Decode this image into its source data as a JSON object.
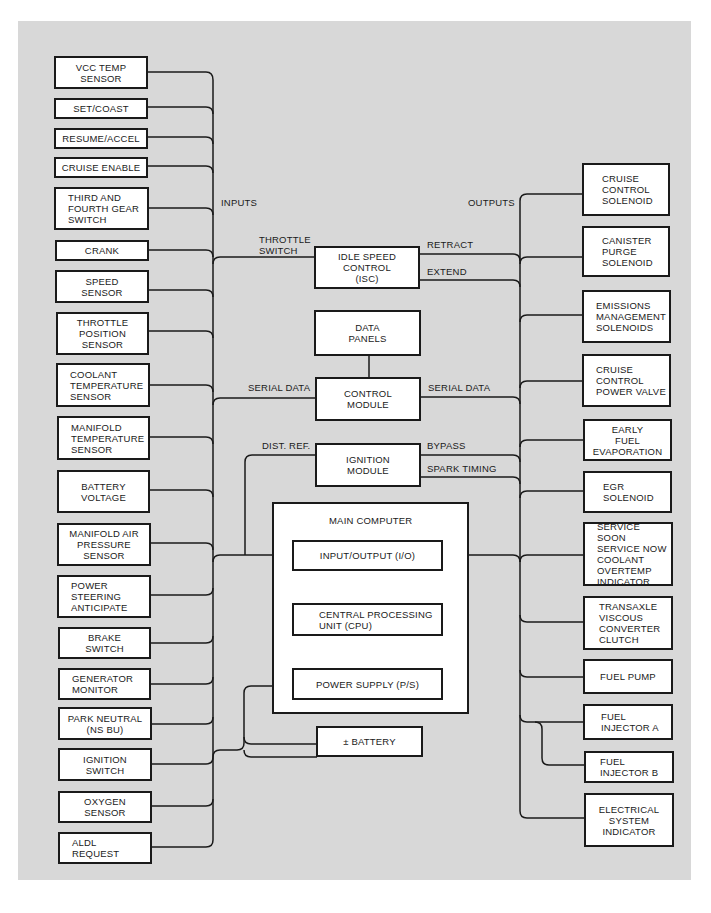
{
  "diagram": {
    "type": "block-diagram",
    "bus_labels": {
      "inputs": "INPUTS",
      "outputs": "OUTPUTS"
    },
    "inputs": [
      {
        "label": "VCC TEMP\nSENSOR"
      },
      {
        "label": "SET/COAST"
      },
      {
        "label": "RESUME/ACCEL"
      },
      {
        "label": "CRUISE ENABLE"
      },
      {
        "label": "THIRD AND\nFOURTH GEAR\nSWITCH"
      },
      {
        "label": "CRANK"
      },
      {
        "label": "SPEED\nSENSOR"
      },
      {
        "label": "THROTTLE\nPOSITION\nSENSOR"
      },
      {
        "label": "COOLANT\nTEMPERATURE\nSENSOR"
      },
      {
        "label": "MANIFOLD\nTEMPERATURE\nSENSOR"
      },
      {
        "label": "BATTERY\nVOLTAGE"
      },
      {
        "label": "MANIFOLD AIR\nPRESSURE\nSENSOR"
      },
      {
        "label": "POWER\nSTEERING\nANTICIPATE"
      },
      {
        "label": "BRAKE\nSWITCH"
      },
      {
        "label": "GENERATOR\nMONITOR"
      },
      {
        "label": "PARK NEUTRAL\n(NS BU)"
      },
      {
        "label": "IGNITION\nSWITCH"
      },
      {
        "label": "OXYGEN\nSENSOR"
      },
      {
        "label": "ALDL\nREQUEST"
      }
    ],
    "outputs": [
      {
        "label": "CRUISE\nCONTROL\nSOLENOID"
      },
      {
        "label": "CANISTER\nPURGE\nSOLENOID"
      },
      {
        "label": "EMISSIONS\nMANAGEMENT\nSOLENOIDS"
      },
      {
        "label": "CRUISE\nCONTROL\nPOWER VALVE"
      },
      {
        "label": "EARLY\nFUEL\nEVAPORATION"
      },
      {
        "label": "EGR\nSOLENOID"
      },
      {
        "label": "SERVICE SOON\nSERVICE NOW\nCOOLANT\nOVERTEMP\nINDICATOR"
      },
      {
        "label": "TRANSAXLE\nVISCOUS\nCONVERTER\nCLUTCH"
      },
      {
        "label": "FUEL PUMP"
      },
      {
        "label": "FUEL\nINJECTOR A"
      },
      {
        "label": "FUEL\nINJECTOR B"
      },
      {
        "label": "ELECTRICAL\nSYSTEM\nINDICATOR"
      }
    ],
    "center": {
      "isc": "IDLE SPEED\nCONTROL\n(ISC)",
      "data_panels": "DATA\nPANELS",
      "control_module": "CONTROL\nMODULE",
      "ignition_module": "IGNITION\nMODULE",
      "main_computer": {
        "title": "MAIN COMPUTER",
        "io": "INPUT/OUTPUT (I/O)",
        "cpu": "CENTRAL PROCESSING\nUNIT (CPU)",
        "ps": "POWER SUPPLY (P/S)"
      },
      "battery": "± BATTERY"
    },
    "signal_labels": {
      "throttle_switch": "THROTTLE\nSWITCH",
      "retract": "RETRACT",
      "extend": "EXTEND",
      "serial_data_in": "SERIAL DATA",
      "serial_data_out": "SERIAL DATA",
      "dist_ref": "DIST. REF.",
      "bypass": "BYPASS",
      "spark_timing": "SPARK TIMING"
    },
    "colors": {
      "background": "#d8d8d8",
      "box_fill": "#ffffff",
      "line": "#1a1a1a"
    }
  }
}
